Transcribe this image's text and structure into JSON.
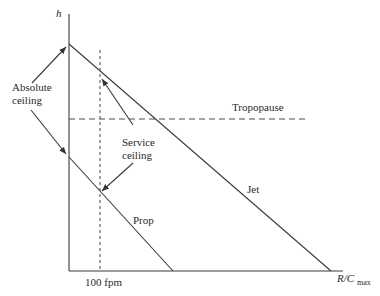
{
  "diagram": {
    "axes": {
      "y_label": "h",
      "x_label_main": "R/C",
      "x_label_sub": "max",
      "x_tick_label": "100 fpm"
    },
    "lines": {
      "jet_label": "Jet",
      "prop_label": "Prop",
      "tropopause_label": "Tropopause"
    },
    "annotations": {
      "absolute_ceiling_line1": "Absolute",
      "absolute_ceiling_line2": "ceiling",
      "service_ceiling_line1": "Service",
      "service_ceiling_line2": "ceiling"
    },
    "colors": {
      "stroke": "#3a3a3a",
      "text": "#2a2a2a",
      "background": "#ffffff"
    }
  }
}
